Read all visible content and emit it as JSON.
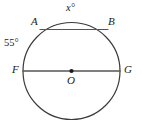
{
  "figure": {
    "type": "circle-geometry-diagram",
    "background_color": "#ffffff",
    "stroke_color": "#3b3b3b",
    "text_color": "#1a1a1a",
    "circle": {
      "center_label": "O",
      "center_x": 71.5,
      "center_y": 71,
      "radius": 48.5
    },
    "labels": {
      "point_a": "A",
      "point_b": "B",
      "point_f": "F",
      "point_g": "G",
      "center": "O",
      "arc_x": "x°",
      "angle_55": "55°"
    },
    "segments": {
      "chord_ab": {
        "name": "AB",
        "x1": 40,
        "y1": 29.5,
        "x2": 108,
        "y2": 29.5
      },
      "diameter_fg": {
        "name": "FG",
        "x1": 23,
        "y1": 71,
        "x2": 120,
        "y2": 71
      }
    }
  }
}
